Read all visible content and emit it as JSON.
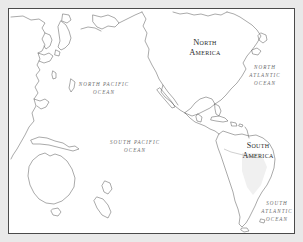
{
  "map": {
    "title": "Pacific Ocean World Map",
    "frame": {
      "border_color": "#4a4a4a",
      "margin_color": "#e9e9e9",
      "background": "#ffffff"
    },
    "coastline_color": "#555555",
    "continent_labels": [
      {
        "name": "north-america",
        "line1": "North",
        "line2": "America",
        "x": 196,
        "y": 36,
        "size": 8.4
      },
      {
        "name": "south-america",
        "line1": "South",
        "line2": "America",
        "x": 249,
        "y": 139,
        "size": 8.0
      }
    ],
    "ocean_labels": [
      {
        "name": "north-pacific-ocean",
        "line1": "NORTH PACIFIC",
        "line2": "OCEAN",
        "x": 95,
        "y": 77
      },
      {
        "name": "south-pacific-ocean",
        "line1": "SOUTH PACIFIC",
        "line2": "OCEAN",
        "x": 126,
        "y": 135
      },
      {
        "name": "north-atlantic-ocean",
        "line1": "NORTH",
        "line2": "ATLANTIC",
        "line3": "OCEAN",
        "x": 256,
        "y": 60
      },
      {
        "name": "south-atlantic-ocean",
        "line1": "SOUTH",
        "line2": "ATLANTIC",
        "line3": "OCEAN",
        "x": 268,
        "y": 196
      }
    ]
  }
}
